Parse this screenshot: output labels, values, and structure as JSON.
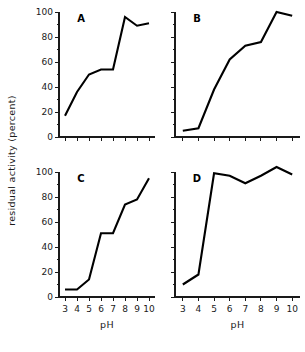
{
  "figure": {
    "ylabel": "residual activity (percent)",
    "xlabel": "pH",
    "panel_labels": [
      "A",
      "B",
      "C",
      "D"
    ]
  },
  "axes": {
    "x_ticks": [
      "3",
      "4",
      "5",
      "6",
      "7",
      "8",
      "9",
      "10"
    ],
    "y_ticks": [
      "0",
      "20",
      "40",
      "60",
      "80",
      "100"
    ],
    "xlim": [
      2.5,
      10.5
    ],
    "ylim": [
      0,
      100
    ]
  },
  "chart_data": [
    {
      "type": "line",
      "title": "A",
      "xlabel": "pH",
      "ylabel": "residual activity (percent)",
      "x": [
        3,
        4,
        5,
        6,
        7,
        8,
        9,
        10
      ],
      "values": [
        17,
        36,
        50,
        54,
        54,
        96,
        89,
        91
      ],
      "xlim": [
        2.5,
        10.5
      ],
      "ylim": [
        0,
        100
      ],
      "grid": false,
      "legend": "none"
    },
    {
      "type": "line",
      "title": "B",
      "xlabel": "pH",
      "ylabel": "residual activity (percent)",
      "x": [
        3,
        4,
        5,
        6,
        7,
        8,
        9,
        10
      ],
      "values": [
        5,
        7,
        38,
        62,
        73,
        76,
        100,
        97
      ],
      "xlim": [
        2.5,
        10.5
      ],
      "ylim": [
        0,
        100
      ],
      "grid": false,
      "legend": "none"
    },
    {
      "type": "line",
      "title": "C",
      "xlabel": "pH",
      "ylabel": "residual activity (percent)",
      "x": [
        3,
        4,
        5,
        6,
        7,
        8,
        9,
        10
      ],
      "values": [
        6,
        6,
        14,
        51,
        51,
        74,
        78,
        95
      ],
      "xlim": [
        2.5,
        10.5
      ],
      "ylim": [
        0,
        100
      ],
      "grid": false,
      "legend": "none"
    },
    {
      "type": "line",
      "title": "D",
      "xlabel": "pH",
      "ylabel": "residual activity (percent)",
      "x": [
        3,
        4,
        5,
        6,
        7,
        8,
        9,
        10
      ],
      "values": [
        10,
        18,
        99,
        97,
        91,
        97,
        104,
        98
      ],
      "xlim": [
        2.5,
        10.5
      ],
      "ylim": [
        0,
        100
      ],
      "grid": false,
      "legend": "none"
    }
  ]
}
